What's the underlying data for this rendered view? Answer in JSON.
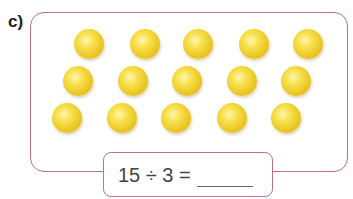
{
  "exercise": {
    "label": "c)",
    "ball_color": "#f2d33a",
    "border_color": "#c2717f",
    "balls": [
      {
        "x": 89,
        "y": 44
      },
      {
        "x": 145,
        "y": 44
      },
      {
        "x": 198,
        "y": 44
      },
      {
        "x": 254,
        "y": 44
      },
      {
        "x": 308,
        "y": 44
      },
      {
        "x": 78,
        "y": 81
      },
      {
        "x": 133,
        "y": 81
      },
      {
        "x": 187,
        "y": 81
      },
      {
        "x": 242,
        "y": 81
      },
      {
        "x": 296,
        "y": 81
      },
      {
        "x": 67,
        "y": 118
      },
      {
        "x": 122,
        "y": 118
      },
      {
        "x": 176,
        "y": 118
      },
      {
        "x": 232,
        "y": 118
      },
      {
        "x": 286,
        "y": 118
      }
    ],
    "ball_count": 15,
    "equation": {
      "text": "15 ÷ 3 =",
      "answer": ""
    }
  }
}
